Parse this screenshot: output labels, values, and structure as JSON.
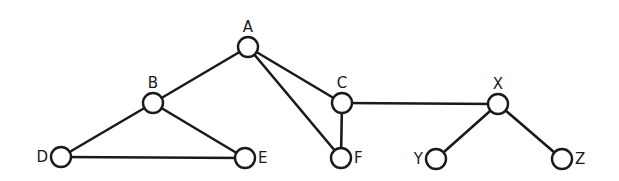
{
  "diagram": {
    "type": "undirected-graph",
    "width": 619,
    "height": 181,
    "node_radius": 10,
    "colors": {
      "stroke": "#1a1a1a",
      "node_fill": "#ffffff",
      "background": "#ffffff"
    },
    "nodes": [
      {
        "id": "A",
        "label": "A",
        "x": 248,
        "y": 47,
        "label_pos": "top"
      },
      {
        "id": "B",
        "label": "B",
        "x": 153,
        "y": 103,
        "label_pos": "top"
      },
      {
        "id": "C",
        "label": "C",
        "x": 342,
        "y": 103,
        "label_pos": "top"
      },
      {
        "id": "D",
        "label": "D",
        "x": 61,
        "y": 157,
        "label_pos": "left"
      },
      {
        "id": "E",
        "label": "E",
        "x": 245,
        "y": 158,
        "label_pos": "right"
      },
      {
        "id": "F",
        "label": "F",
        "x": 341,
        "y": 158,
        "label_pos": "right"
      },
      {
        "id": "X",
        "label": "X",
        "x": 498,
        "y": 104,
        "label_pos": "top"
      },
      {
        "id": "Y",
        "label": "Y",
        "x": 436,
        "y": 159,
        "label_pos": "left"
      },
      {
        "id": "Z",
        "label": "Z",
        "x": 562,
        "y": 159,
        "label_pos": "right"
      }
    ],
    "edges": [
      {
        "from": "A",
        "to": "B"
      },
      {
        "from": "A",
        "to": "C"
      },
      {
        "from": "A",
        "to": "F"
      },
      {
        "from": "B",
        "to": "D"
      },
      {
        "from": "B",
        "to": "E"
      },
      {
        "from": "D",
        "to": "E"
      },
      {
        "from": "C",
        "to": "F"
      },
      {
        "from": "C",
        "to": "X"
      },
      {
        "from": "X",
        "to": "Y"
      },
      {
        "from": "X",
        "to": "Z"
      }
    ]
  }
}
